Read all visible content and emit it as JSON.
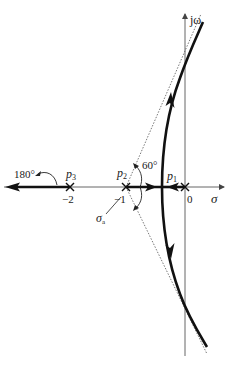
{
  "diagram": {
    "type": "root-locus",
    "axes": {
      "real_label": "σ",
      "imag_label": "jω",
      "ticks": [
        {
          "value": 0,
          "label": "0"
        },
        {
          "value": -1,
          "label": "−1"
        },
        {
          "value": -2,
          "label": "−2"
        }
      ]
    },
    "poles": [
      {
        "name": "p1",
        "label_main": "p",
        "label_sub": "1",
        "value": 0
      },
      {
        "name": "p2",
        "label_main": "p",
        "label_sub": "2",
        "value": -1
      },
      {
        "name": "p3",
        "label_main": "p",
        "label_sub": "3",
        "value": -2
      }
    ],
    "asymptotes": {
      "centroid_label_main": "σ",
      "centroid_label_sub": "a",
      "centroid_value": -1,
      "angles": [
        "60°",
        "180°",
        "−60°"
      ]
    },
    "angle_labels": {
      "a60": "60°",
      "a180": "180°"
    }
  }
}
